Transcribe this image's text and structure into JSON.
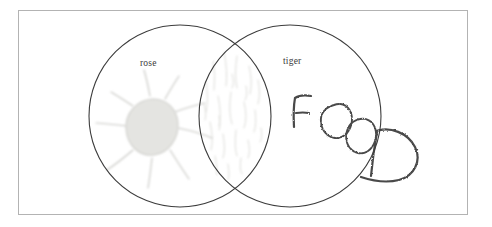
{
  "figure": {
    "type": "venn-diagram",
    "medium": "hand-drawn pencil sketch on paper",
    "background_color": "#ffffff",
    "frame": {
      "present": true,
      "color": "#b3b3b3",
      "x": 18,
      "y": 10,
      "width": 450,
      "height": 205
    }
  },
  "labels": {
    "left": "rose",
    "right": "tiger",
    "color": "#3a3a3a",
    "font_size_px": 9.5
  },
  "circles": [
    {
      "id": "left-circle",
      "label": "rose",
      "cx": 180,
      "cy": 116,
      "r": 91,
      "stroke": "#3c3c3c",
      "stroke_width": 1.1,
      "fill": "none"
    },
    {
      "id": "right-circle",
      "label": "tiger",
      "cx": 290,
      "cy": 116,
      "r": 91,
      "stroke": "#3c3c3c",
      "stroke_width": 1.1,
      "fill": "none"
    }
  ],
  "intersections": {
    "top_point": {
      "x": 235,
      "y": 40
    },
    "bottom_point": {
      "x": 235,
      "y": 192
    }
  },
  "sketches": [
    {
      "id": "flower-blob",
      "region": "left-circle-only",
      "description": "pale gray rounded blob with radiating petal strokes, flower or sun",
      "cx": 152,
      "cy": 132,
      "fill": "#e2e2e0",
      "stroke": "#c9c9c6",
      "ray_count": 8,
      "ray_color": "#c8c8c4"
    },
    {
      "id": "lens-hatching",
      "region": "overlap-lens",
      "description": "faint vertical scribble hatching filling the overlap lens",
      "stroke": "#dcdcd8",
      "stroke_count": 22
    },
    {
      "id": "handwritten-food",
      "region": "right-circle",
      "description": "hand-printed word descending diagonally, last letter extends outside the circle",
      "text": "FOOD",
      "letters": [
        "F",
        "O",
        "O",
        "D"
      ],
      "stroke": "#4a4a4a"
    }
  ],
  "chart_data": {
    "type": "venn",
    "title": "",
    "sets": [
      {
        "name": "rose",
        "cx": 180,
        "cy": 116,
        "r": 91
      },
      {
        "name": "tiger",
        "cx": 290,
        "cy": 116,
        "r": 91
      }
    ],
    "regions": [
      {
        "region": "rose only",
        "content": "flower / sun blob sketch with radiating petals"
      },
      {
        "region": "rose ∩ tiger",
        "content": "faint vertical hatching texture"
      },
      {
        "region": "tiger only",
        "content": "handwritten word FOOD (D overflows the circle)"
      }
    ],
    "legend": [
      "rose",
      "tiger"
    ],
    "grid": false
  }
}
